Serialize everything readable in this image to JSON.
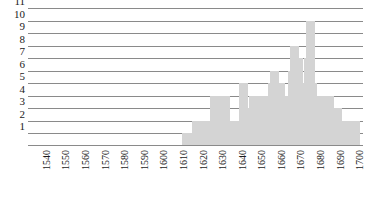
{
  "chart_data": {
    "type": "bar",
    "title": "",
    "subtitle": "",
    "xlabel": "",
    "ylabel": "",
    "xlim": [
      1535,
      1706
    ],
    "ylim": [
      0,
      11
    ],
    "grid": true,
    "legend": null,
    "bar_color": "#d4d4d4",
    "axis_color": "#8a8a8a",
    "bin_width_years": 1,
    "y_ticks": [
      1,
      2,
      3,
      4,
      5,
      6,
      7,
      8,
      9,
      10,
      11
    ],
    "y_tick_labels": [
      "1",
      "2",
      "3",
      "4",
      "5",
      "6",
      "7",
      "8",
      "9",
      "10",
      "11"
    ],
    "x_ticks": [
      1540,
      1550,
      1560,
      1570,
      1580,
      1590,
      1600,
      1610,
      1620,
      1630,
      1640,
      1650,
      1660,
      1670,
      1680,
      1690,
      1700
    ],
    "x_tick_labels": [
      "1540",
      "1550",
      "1560",
      "1570",
      "1580",
      "1590",
      "1600",
      "1610",
      "1620",
      "1630",
      "1640",
      "1650",
      "1660",
      "1670",
      "1680",
      "1690",
      "1700"
    ],
    "categories": [
      1616,
      1619,
      1621,
      1623,
      1625,
      1627,
      1629,
      1630,
      1631,
      1632,
      1634,
      1636,
      1638,
      1640,
      1642,
      1645,
      1647,
      1649,
      1650,
      1651,
      1653,
      1655,
      1657,
      1658,
      1660,
      1661,
      1663,
      1664,
      1665,
      1667,
      1668,
      1670,
      1671,
      1672,
      1673,
      1675,
      1676,
      1678,
      1679,
      1680,
      1681,
      1683,
      1685,
      1687,
      1689,
      1691,
      1693,
      1695,
      1697,
      1700,
      1702
    ],
    "values": [
      1,
      1,
      2,
      2,
      1,
      2,
      2,
      4,
      4,
      2,
      2,
      4,
      2,
      1,
      2,
      5,
      2,
      3,
      4,
      4,
      4,
      3,
      4,
      4,
      5,
      6,
      4,
      5,
      4,
      4,
      4,
      6,
      8,
      4,
      7,
      4,
      5,
      7,
      10,
      5,
      4,
      4,
      4,
      4,
      4,
      3,
      3,
      2,
      2,
      2,
      2
    ]
  }
}
